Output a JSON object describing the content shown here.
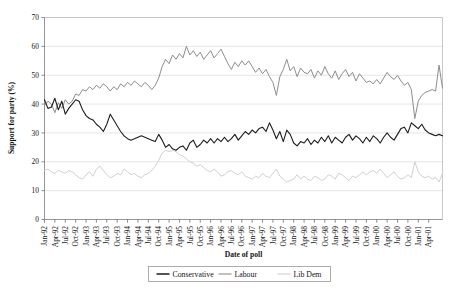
{
  "page": {
    "cropped_header_text": "partial line of body text cut off at top of figure"
  },
  "chart_data": {
    "type": "line",
    "title": "",
    "xlabel": "Date of poll",
    "ylabel": "Support for party (%)",
    "ylim": [
      0,
      70
    ],
    "ytick_step": 10,
    "yticks": [
      0,
      10,
      20,
      30,
      40,
      50,
      60,
      70
    ],
    "grid": true,
    "legend_position": "bottom",
    "x_tick_labels": [
      "Jan-92",
      "Apr-92",
      "Jul-92",
      "Oct-92",
      "Jan-93",
      "Apr-93",
      "Jul-93",
      "Oct-93",
      "Jan-94",
      "Apr-94",
      "Jul-94",
      "Oct-94",
      "Jan-95",
      "Apr-95",
      "Jul-95",
      "Oct-95",
      "Jan-96",
      "Apr-96",
      "Jul-96",
      "Oct-96",
      "Jan-97",
      "Apr-97",
      "Jul-97",
      "Oct-97",
      "Jan-98",
      "Apr-98",
      "Jul-98",
      "Oct-98",
      "Jan-99",
      "Apr-99",
      "Jul-99",
      "Oct-99",
      "Jan-00",
      "Apr-00",
      "Jul-00",
      "Oct-00",
      "Jan-01",
      "Apr-01"
    ],
    "x_tick_interval_months": 3,
    "x_start": "Jan-92",
    "x_end": "Jun-01",
    "series": [
      {
        "name": "Conservative",
        "color": "#1c1c1c",
        "width": 1.1,
        "values": [
          41.5,
          38.5,
          39.0,
          42.0,
          38.0,
          41.0,
          36.5,
          38.5,
          40.0,
          41.5,
          41.0,
          38.0,
          36.0,
          35.0,
          34.5,
          33.0,
          32.0,
          30.5,
          33.0,
          36.5,
          34.5,
          32.5,
          30.5,
          29.0,
          28.0,
          27.5,
          28.0,
          28.5,
          29.0,
          28.5,
          28.0,
          27.5,
          27.0,
          29.5,
          27.5,
          25.0,
          26.0,
          24.5,
          24.0,
          25.0,
          25.5,
          24.0,
          26.5,
          27.5,
          25.0,
          26.0,
          27.5,
          26.5,
          28.0,
          26.5,
          28.0,
          27.0,
          28.5,
          27.0,
          28.0,
          29.5,
          27.5,
          29.0,
          30.5,
          29.5,
          31.0,
          30.0,
          31.5,
          32.0,
          30.5,
          33.5,
          31.0,
          28.0,
          30.5,
          27.0,
          31.0,
          29.5,
          26.5,
          25.5,
          27.0,
          26.5,
          28.0,
          26.0,
          27.5,
          26.5,
          28.5,
          27.0,
          29.0,
          26.5,
          28.5,
          27.5,
          26.5,
          28.5,
          29.5,
          27.5,
          29.0,
          28.0,
          26.5,
          28.5,
          27.0,
          29.0,
          28.0,
          26.5,
          28.5,
          30.0,
          28.5,
          27.5,
          29.5,
          31.5,
          32.0,
          30.0,
          33.5,
          32.5,
          31.5,
          33.0,
          31.0,
          30.0,
          29.5,
          29.0,
          29.5,
          29.0
        ]
      },
      {
        "name": "Labour",
        "color": "#8d8d8d",
        "width": 1.0,
        "values": [
          39.5,
          41.0,
          40.0,
          37.0,
          40.5,
          38.5,
          41.5,
          40.0,
          41.0,
          43.5,
          43.0,
          45.0,
          44.5,
          46.0,
          45.0,
          46.5,
          45.5,
          47.0,
          46.0,
          44.5,
          46.0,
          45.0,
          47.0,
          46.0,
          47.5,
          46.5,
          48.0,
          47.0,
          46.0,
          47.5,
          46.5,
          45.0,
          46.5,
          49.0,
          53.0,
          55.5,
          54.0,
          57.0,
          55.5,
          57.5,
          56.0,
          60.0,
          57.0,
          58.5,
          56.5,
          58.0,
          55.5,
          57.0,
          58.5,
          56.0,
          57.5,
          59.0,
          56.5,
          54.0,
          52.0,
          54.5,
          53.0,
          55.0,
          53.5,
          55.0,
          53.0,
          51.0,
          52.5,
          50.5,
          52.0,
          49.5,
          47.5,
          43.0,
          49.5,
          52.0,
          55.5,
          51.5,
          53.0,
          49.5,
          52.5,
          51.0,
          50.5,
          52.0,
          49.0,
          51.5,
          50.0,
          53.0,
          50.5,
          49.0,
          51.5,
          48.5,
          50.5,
          52.0,
          49.5,
          51.0,
          48.0,
          50.5,
          49.0,
          47.5,
          48.0,
          47.0,
          48.5,
          47.0,
          49.0,
          51.0,
          49.5,
          48.5,
          50.0,
          48.0,
          46.5,
          47.5,
          45.0,
          35.0,
          41.0,
          43.0,
          44.0,
          44.5,
          45.0,
          44.5,
          53.5,
          45.5
        ]
      },
      {
        "name": "Lib Dem",
        "color": "#d0d0d0",
        "width": 1.0,
        "values": [
          17.0,
          17.5,
          16.5,
          16.0,
          17.0,
          16.5,
          16.0,
          17.0,
          16.5,
          15.5,
          14.5,
          14.0,
          15.5,
          16.5,
          15.0,
          17.5,
          18.5,
          17.0,
          15.5,
          14.5,
          15.0,
          16.0,
          15.5,
          17.5,
          16.5,
          15.5,
          16.0,
          15.0,
          14.5,
          15.5,
          16.0,
          17.0,
          18.5,
          20.5,
          23.0,
          24.0,
          23.5,
          24.0,
          23.5,
          22.5,
          22.0,
          21.0,
          20.0,
          19.5,
          18.5,
          19.0,
          18.0,
          17.0,
          16.5,
          17.5,
          16.5,
          15.0,
          15.5,
          16.5,
          17.0,
          16.0,
          15.5,
          16.5,
          15.0,
          14.5,
          14.0,
          15.0,
          14.5,
          16.0,
          15.0,
          14.5,
          16.0,
          17.5,
          15.0,
          14.0,
          13.0,
          13.5,
          14.0,
          15.5,
          14.0,
          15.0,
          14.0,
          13.5,
          15.0,
          14.5,
          13.5,
          14.0,
          15.5,
          15.0,
          14.0,
          16.0,
          15.5,
          14.5,
          13.5,
          15.0,
          14.5,
          15.5,
          16.5,
          15.5,
          16.5,
          17.0,
          16.0,
          17.5,
          16.0,
          14.5,
          15.5,
          16.5,
          15.0,
          14.0,
          14.5,
          15.5,
          14.5,
          20.0,
          16.5,
          15.0,
          14.5,
          15.0,
          14.0,
          14.5,
          13.0,
          16.0
        ]
      }
    ],
    "legend_entries": [
      {
        "label": "Conservative",
        "color": "#1c1c1c"
      },
      {
        "label": "Labour",
        "color": "#8d8d8d"
      },
      {
        "label": "Lib Dem",
        "color": "#d0d0d0"
      }
    ]
  }
}
